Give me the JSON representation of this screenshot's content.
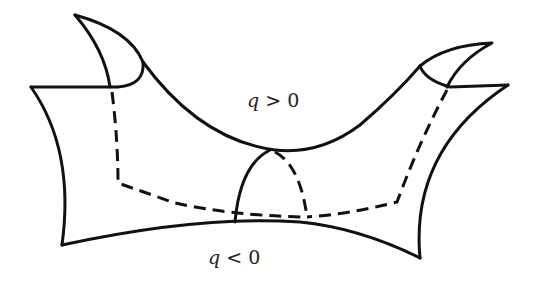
{
  "diagram": {
    "type": "saddle-surface",
    "labels": {
      "upper": {
        "var": "q",
        "rel": ">",
        "val": "0"
      },
      "lower": {
        "var": "q",
        "rel": "<",
        "val": "0"
      }
    },
    "colors": {
      "stroke": "#111111",
      "background": "#ffffff"
    }
  }
}
